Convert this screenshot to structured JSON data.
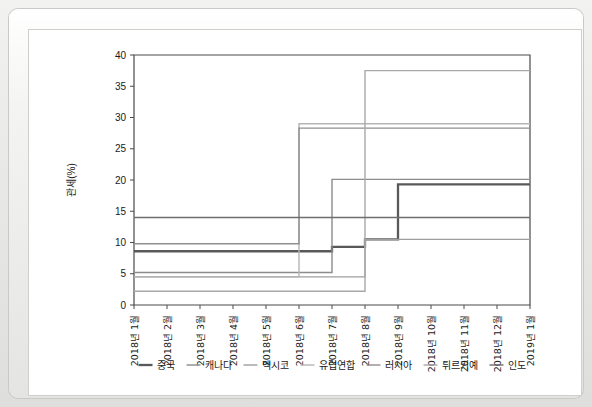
{
  "chart_data": {
    "type": "line",
    "title": "",
    "subtitle": "",
    "xlabel": "",
    "ylabel": "관세(%)",
    "ylim": [
      0,
      40
    ],
    "yticks": [
      0,
      5,
      10,
      15,
      20,
      25,
      30,
      35,
      40
    ],
    "ytick_labels": [
      "0",
      "5",
      "10",
      "15",
      "20",
      "25",
      "30",
      "35",
      "40"
    ],
    "grid": false,
    "legend_position": "bottom",
    "step_style": "post",
    "categories": [
      "2018년 1월",
      "2018년 2월",
      "2018년 3월",
      "2018년 4월",
      "2018년 5월",
      "2018년 6월",
      "2018년 7월",
      "2018년 8월",
      "2018년 9월",
      "2018년 10월",
      "2018년 11월",
      "2018년 12월",
      "2019년 1월"
    ],
    "series": [
      {
        "name": "중국",
        "color": "#595959",
        "width": 2.3,
        "values": [
          8.6,
          8.6,
          8.6,
          8.6,
          8.6,
          8.6,
          9.3,
          10.5,
          19.3,
          19.3,
          19.3,
          19.3,
          19.3
        ]
      },
      {
        "name": "캐나다",
        "color": "#8c8c8c",
        "width": 1.4,
        "values": [
          5.2,
          5.2,
          5.2,
          5.2,
          5.2,
          5.2,
          20.1,
          20.1,
          20.1,
          20.1,
          20.1,
          20.1,
          20.1
        ]
      },
      {
        "name": "멕시코",
        "color": "#9e9e9e",
        "width": 1.4,
        "values": [
          4.5,
          4.5,
          4.5,
          4.5,
          4.5,
          4.5,
          4.5,
          10.5,
          10.5,
          10.5,
          10.5,
          10.5,
          10.5
        ]
      },
      {
        "name": "유럽연합",
        "color": "#b5b5b5",
        "width": 1.4,
        "values": [
          4.5,
          4.5,
          4.5,
          4.5,
          4.5,
          29.0,
          29.0,
          29.0,
          29.0,
          29.0,
          29.0,
          29.0,
          29.0
        ]
      },
      {
        "name": "러시아",
        "color": "#8f8f8f",
        "width": 1.4,
        "values": [
          9.8,
          9.8,
          9.8,
          9.8,
          9.8,
          28.3,
          28.3,
          28.3,
          28.3,
          28.3,
          28.3,
          28.3,
          28.3
        ]
      },
      {
        "name": "튀르키예",
        "color": "#a8a8a8",
        "width": 1.4,
        "values": [
          2.2,
          2.2,
          2.2,
          2.2,
          2.2,
          2.2,
          2.2,
          37.5,
          37.5,
          37.5,
          37.5,
          37.5,
          37.5
        ]
      },
      {
        "name": "인도",
        "color": "#6e6e6e",
        "width": 1.4,
        "values": [
          14.0,
          14.0,
          14.0,
          14.0,
          14.0,
          14.0,
          14.0,
          14.0,
          14.0,
          14.0,
          14.0,
          14.0,
          14.0
        ]
      }
    ]
  }
}
